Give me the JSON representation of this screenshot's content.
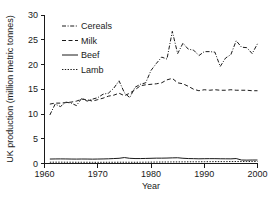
{
  "chart_data": {
    "type": "line",
    "title": "",
    "xlabel": "Year",
    "ylabel": "UK production (million metric tonnes)",
    "xlim": [
      1960,
      2000
    ],
    "ylim": [
      0,
      30
    ],
    "xticks": [
      1960,
      1970,
      1980,
      1990,
      2000
    ],
    "yticks": [
      0,
      5,
      10,
      15,
      20,
      25,
      30
    ],
    "xticklabels": [
      "1960",
      "1970",
      "1980",
      "1990",
      "2000"
    ],
    "yticklabels": [
      "0",
      "5",
      "10",
      "15",
      "20",
      "25",
      "30"
    ],
    "grid": false,
    "legend_position": "upper left",
    "x": [
      1961,
      1962,
      1963,
      1964,
      1965,
      1966,
      1967,
      1968,
      1969,
      1970,
      1971,
      1972,
      1973,
      1974,
      1975,
      1976,
      1977,
      1978,
      1979,
      1980,
      1981,
      1982,
      1983,
      1984,
      1985,
      1986,
      1987,
      1988,
      1989,
      1990,
      1991,
      1992,
      1993,
      1994,
      1995,
      1996,
      1997,
      1998,
      1999,
      2000
    ],
    "series": [
      {
        "name": "Cereals",
        "dash": "dash-dot",
        "values": [
          9.8,
          12.0,
          11.5,
          12.4,
          12.2,
          11.7,
          13.2,
          12.6,
          13.0,
          13.3,
          14.0,
          14.2,
          15.2,
          16.7,
          14.3,
          13.3,
          15.4,
          16.0,
          16.3,
          18.8,
          20.2,
          21.5,
          21.1,
          26.7,
          22.2,
          24.3,
          23.1,
          22.9,
          21.8,
          22.6,
          22.6,
          22.5,
          19.6,
          21.3,
          22.0,
          24.8,
          23.5,
          23.4,
          22.2,
          24.2
        ]
      },
      {
        "name": "Milk",
        "dash": "dashed",
        "values": [
          12.0,
          12.2,
          12.2,
          12.3,
          12.4,
          12.6,
          13.0,
          12.9,
          12.6,
          12.9,
          13.2,
          13.6,
          13.8,
          14.2,
          13.7,
          14.2,
          14.9,
          15.7,
          15.9,
          16.0,
          16.1,
          16.3,
          16.9,
          17.2,
          16.3,
          16.1,
          15.6,
          15.0,
          14.7,
          14.9,
          14.8,
          14.9,
          14.8,
          14.8,
          14.9,
          14.8,
          14.8,
          14.8,
          14.7,
          14.7
        ]
      },
      {
        "name": "Beef",
        "dash": "solid",
        "values": [
          0.9,
          0.92,
          0.93,
          0.92,
          0.9,
          0.89,
          0.91,
          0.9,
          0.88,
          0.9,
          0.92,
          0.95,
          1.0,
          1.05,
          1.2,
          1.05,
          1.0,
          1.0,
          1.02,
          1.05,
          1.08,
          1.08,
          1.1,
          1.14,
          1.16,
          1.06,
          1.0,
          0.98,
          0.95,
          0.97,
          0.98,
          0.98,
          0.96,
          0.95,
          0.94,
          1.0,
          0.7,
          0.68,
          0.7,
          0.7
        ]
      },
      {
        "name": "Lamb",
        "dash": "dotted",
        "values": [
          0.26,
          0.27,
          0.27,
          0.26,
          0.26,
          0.25,
          0.25,
          0.25,
          0.24,
          0.24,
          0.25,
          0.25,
          0.25,
          0.26,
          0.26,
          0.25,
          0.25,
          0.26,
          0.27,
          0.28,
          0.29,
          0.3,
          0.31,
          0.32,
          0.32,
          0.33,
          0.34,
          0.35,
          0.35,
          0.36,
          0.37,
          0.38,
          0.38,
          0.38,
          0.39,
          0.4,
          0.4,
          0.4,
          0.4,
          0.4
        ]
      }
    ]
  },
  "legend": {
    "items": [
      {
        "label": "Cereals"
      },
      {
        "label": "Milk"
      },
      {
        "label": "Beef"
      },
      {
        "label": "Lamb"
      }
    ]
  }
}
